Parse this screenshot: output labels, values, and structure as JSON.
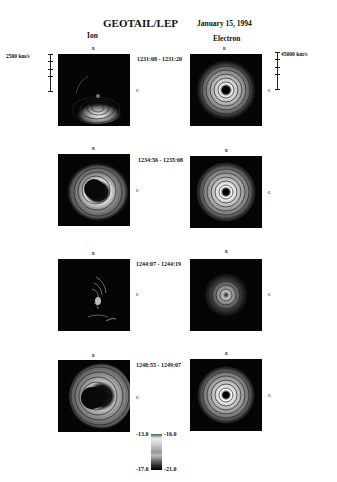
{
  "header": {
    "title": "GEOTAIL/LEP",
    "date": "January 15, 1994"
  },
  "columns": {
    "ion": "Ion",
    "electron": "Electron"
  },
  "axes": {
    "top": "B",
    "right": "C"
  },
  "scale_bars": {
    "ion": "2500 km/s",
    "electron": "45000 km/s"
  },
  "rows": [
    {
      "time": "1231:08 - 1231:20"
    },
    {
      "time": "1234:56 - 1235:08"
    },
    {
      "time": "1244:07 - 1244:19"
    },
    {
      "time": "1248:55 - 1249:07"
    }
  ],
  "colorbar": {
    "ion_max": "-13.0",
    "ion_min": "-17.0",
    "electron_max": "-16.0",
    "electron_min": "-21.0"
  },
  "colors": {
    "background": "#ffffff",
    "plot_bg": "#050505",
    "text": "#111111"
  }
}
